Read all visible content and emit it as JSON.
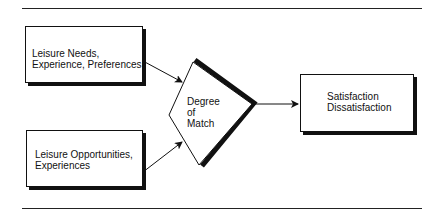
{
  "diagram": {
    "inputs": [
      {
        "line1": "Leisure Needs,",
        "line2": "Experience, Preferences"
      },
      {
        "line1": "Leisure Opportunities,",
        "line2": "Experiences"
      }
    ],
    "comparator": {
      "line1": "Degree",
      "line2": "of",
      "line3": "Match"
    },
    "output": {
      "line1": "Satisfaction",
      "line2": "Dissatisfaction"
    }
  },
  "colors": {
    "stroke": "#111111",
    "background": "#ffffff"
  }
}
